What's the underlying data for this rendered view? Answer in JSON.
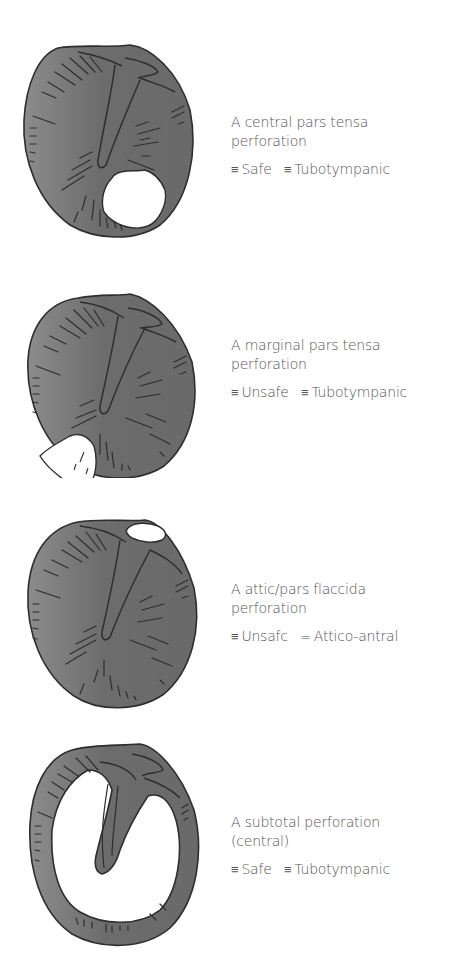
{
  "figure": {
    "colors": {
      "membrane_fill_light": "#8c8c8c",
      "membrane_fill_dark": "#666666",
      "outline": "#2e2e2e",
      "perforation": "#ffffff",
      "caption_text": "#555555"
    },
    "panels": [
      {
        "id": "central",
        "title_line1": "A central pars tensa",
        "title_line2": "perforation",
        "tags": [
          {
            "symbol": "≡",
            "label": "Safe"
          },
          {
            "symbol": "≡",
            "label": "Tubotympanic"
          }
        ]
      },
      {
        "id": "marginal",
        "title_line1": "A marginal pars tensa",
        "title_line2": "perforation",
        "tags": [
          {
            "symbol": "≡",
            "label": "Unsafe"
          },
          {
            "symbol": "≡",
            "label": "Tubotympanic"
          }
        ]
      },
      {
        "id": "attic",
        "title_line1": "A attic/pars flaccida",
        "title_line2": "perforation",
        "tags": [
          {
            "symbol": "≡",
            "label": "Unsafc"
          },
          {
            "symbol": "=",
            "label": "Attico-antral"
          }
        ]
      },
      {
        "id": "subtotal",
        "title_line1": "A subtotal perforation",
        "title_line2": "(central)",
        "tags": [
          {
            "symbol": "≡",
            "label": "Safe"
          },
          {
            "symbol": "≡",
            "label": "Tubotympanic"
          }
        ]
      }
    ]
  }
}
